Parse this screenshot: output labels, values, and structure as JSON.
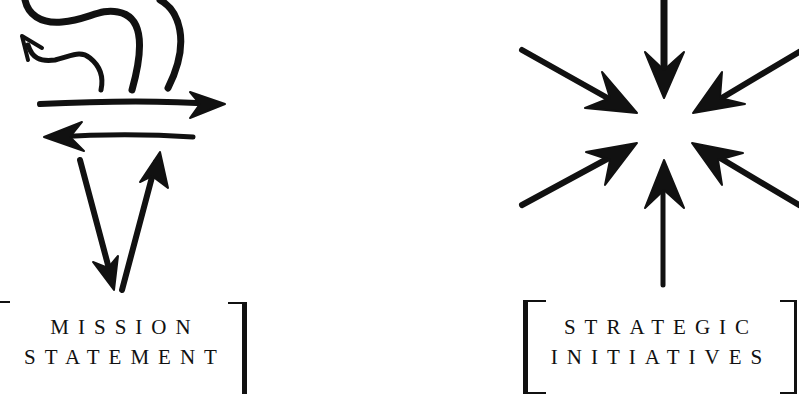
{
  "panels": [
    {
      "id": "mission",
      "icon": "torch-arrows-icon",
      "label_lines": [
        "MISSION",
        "STATEMENT"
      ]
    },
    {
      "id": "strategic",
      "icon": "converging-arrows-starburst-icon",
      "label_lines": [
        "STRATEGIC",
        "INITIATIVES"
      ]
    }
  ],
  "colors": {
    "ink": "#111111",
    "background": "#ffffff"
  }
}
